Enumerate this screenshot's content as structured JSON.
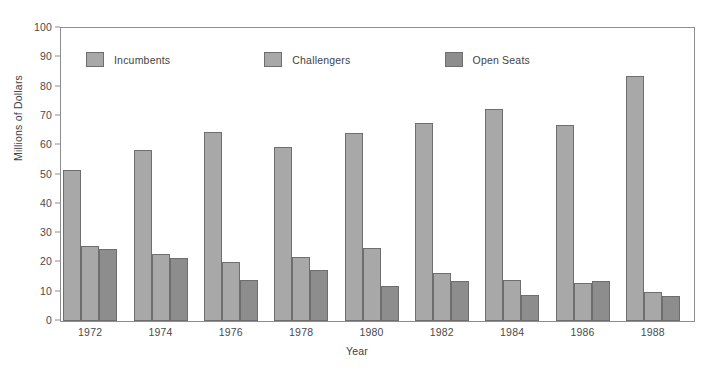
{
  "chart_data": {
    "type": "bar",
    "title": "",
    "xlabel": "Year",
    "ylabel": "Millions of Dollars",
    "categories": [
      "1972",
      "1974",
      "1976",
      "1978",
      "1980",
      "1982",
      "1984",
      "1986",
      "1988"
    ],
    "series": [
      {
        "name": "Incumbents",
        "color": "#a8a8a8",
        "values": [
          51.5,
          58.5,
          64.5,
          59.5,
          64,
          67.5,
          72.5,
          67,
          83.5
        ]
      },
      {
        "name": "Challengers",
        "color": "#a8a8a8",
        "values": [
          25.5,
          23,
          20,
          22,
          25,
          16.5,
          14,
          13,
          10
        ]
      },
      {
        "name": "Open Seats",
        "color": "#8d8d8d",
        "values": [
          24.5,
          21.5,
          14,
          17.5,
          12,
          13.5,
          9,
          13.5,
          8.5
        ]
      }
    ],
    "ylim": [
      0,
      100
    ],
    "y_ticks": [
      "0",
      "10",
      "20",
      "30",
      "40",
      "50",
      "60",
      "70",
      "80",
      "90",
      "100"
    ],
    "grid": false,
    "legend_position": "top-inside-left",
    "frame": true,
    "bar_border_color": "#6e6e6e"
  },
  "legend": {
    "items": [
      {
        "label": "Incumbents"
      },
      {
        "label": "Challengers"
      },
      {
        "label": "Open Seats"
      }
    ]
  }
}
